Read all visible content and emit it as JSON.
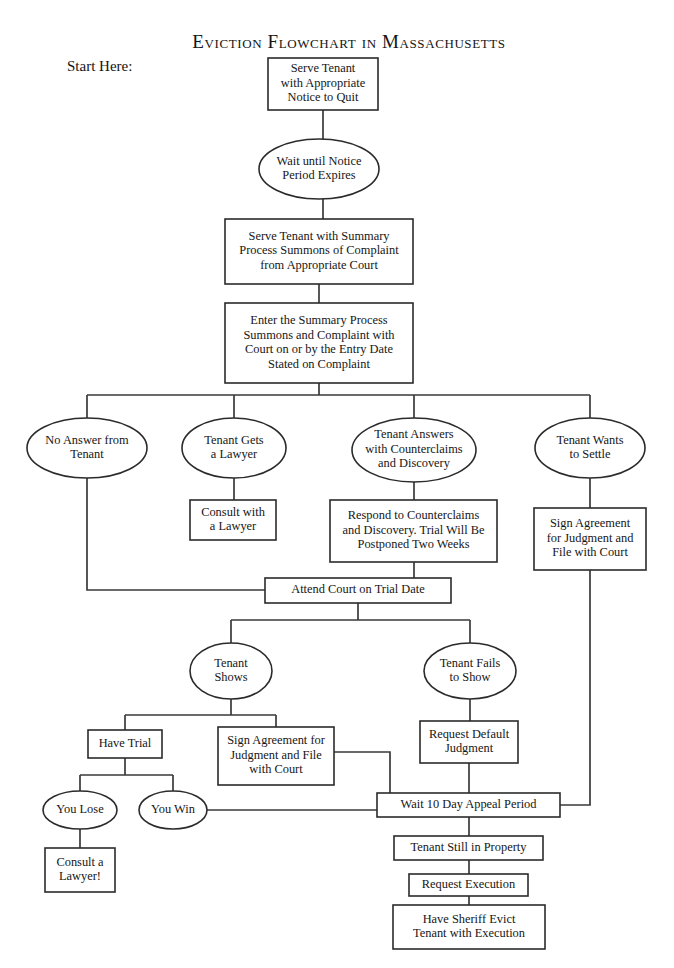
{
  "page": {
    "title": "Eviction Flowchart in Massachusetts",
    "start_label": "Start Here:",
    "background_color": "#ffffff",
    "line_color": "#3a3a3a",
    "text_color": "#161616"
  },
  "chart_data": {
    "type": "diagram",
    "title": "Eviction Flowchart in Massachusetts",
    "subtype": "flowchart",
    "orientation": "top-to-bottom",
    "shapes_legend": {
      "rect": "process / action step",
      "ellipse": "state / decision outcome"
    },
    "nodes": [
      {
        "id": "n1",
        "label": "Serve Tenant with Appropriate Notice to Quit",
        "lines": [
          "Serve Tenant",
          "with Appropriate",
          "Notice to Quit"
        ],
        "shape": "rect",
        "x": 268,
        "y": 58,
        "w": 110,
        "h": 52
      },
      {
        "id": "n2",
        "label": "Wait until Notice Period Expires",
        "lines": [
          "Wait until Notice",
          "Period Expires"
        ],
        "shape": "ellipse",
        "x": 259,
        "y": 139,
        "w": 120,
        "h": 60
      },
      {
        "id": "n3",
        "label": "Serve Tenant with Summary Process Summons of Complaint from Appropriate Court",
        "lines": [
          "Serve Tenant with Summary",
          "Process Summons of Complaint",
          "from Appropriate Court"
        ],
        "shape": "rect",
        "x": 225,
        "y": 219,
        "w": 188,
        "h": 65
      },
      {
        "id": "n4",
        "label": "Enter the Summary Process Summons and Complaint with Court on or by the Entry Date Stated on Complaint",
        "lines": [
          "Enter the Summary Process",
          "Summons and Complaint with",
          "Court on or by the Entry Date",
          "Stated on Complaint"
        ],
        "shape": "rect",
        "x": 225,
        "y": 303,
        "w": 188,
        "h": 80
      },
      {
        "id": "n5",
        "label": "No Answer from Tenant",
        "lines": [
          "No Answer from",
          "Tenant"
        ],
        "shape": "ellipse",
        "x": 27,
        "y": 418,
        "w": 120,
        "h": 60
      },
      {
        "id": "n6",
        "label": "Tenant Gets a Lawyer",
        "lines": [
          "Tenant Gets",
          "a Lawyer"
        ],
        "shape": "ellipse",
        "x": 182,
        "y": 418,
        "w": 104,
        "h": 60
      },
      {
        "id": "n7",
        "label": "Tenant Answers with Counterclaims and Discovery",
        "lines": [
          "Tenant Answers",
          "with Counterclaims",
          "and Discovery"
        ],
        "shape": "ellipse",
        "x": 352,
        "y": 418,
        "w": 124,
        "h": 64
      },
      {
        "id": "n8",
        "label": "Tenant Wants to Settle",
        "lines": [
          "Tenant Wants",
          "to Settle"
        ],
        "shape": "ellipse",
        "x": 535,
        "y": 418,
        "w": 110,
        "h": 60
      },
      {
        "id": "n9",
        "label": "Consult with a Lawyer",
        "lines": [
          "Consult with",
          "a Lawyer"
        ],
        "shape": "rect",
        "x": 190,
        "y": 500,
        "w": 86,
        "h": 40
      },
      {
        "id": "n10",
        "label": "Respond to Counterclaims and Discovery. Trial Will Be Postponed Two Weeks",
        "lines": [
          "Respond to Counterclaims",
          "and Discovery. Trial Will Be",
          "Postponed Two Weeks"
        ],
        "shape": "rect",
        "x": 330,
        "y": 500,
        "w": 167,
        "h": 62
      },
      {
        "id": "n11",
        "label": "Sign Agreement for Judgment and File with Court",
        "lines": [
          "Sign Agreement",
          "for Judgment and",
          "File with Court"
        ],
        "shape": "rect",
        "x": 534,
        "y": 508,
        "w": 112,
        "h": 62
      },
      {
        "id": "n12",
        "label": "Attend Court on Trial Date",
        "lines": [
          "Attend Court on Trial Date"
        ],
        "shape": "rect",
        "x": 265,
        "y": 578,
        "w": 186,
        "h": 25
      },
      {
        "id": "n13",
        "label": "Tenant Shows",
        "lines": [
          "Tenant",
          "Shows"
        ],
        "shape": "ellipse",
        "x": 190,
        "y": 643,
        "w": 82,
        "h": 56
      },
      {
        "id": "n14",
        "label": "Tenant Fails to Show",
        "lines": [
          "Tenant Fails",
          "to Show"
        ],
        "shape": "ellipse",
        "x": 424,
        "y": 643,
        "w": 92,
        "h": 56
      },
      {
        "id": "n15",
        "label": "Have Trial",
        "lines": [
          "Have Trial"
        ],
        "shape": "rect",
        "x": 88,
        "y": 730,
        "w": 74,
        "h": 28
      },
      {
        "id": "n16",
        "label": "Sign Agreement for Judgment and File with Court",
        "lines": [
          "Sign Agreement for",
          "Judgment and File",
          "with Court"
        ],
        "shape": "rect",
        "x": 218,
        "y": 727,
        "w": 116,
        "h": 58
      },
      {
        "id": "n17",
        "label": "Request Default Judgment",
        "lines": [
          "Request Default",
          "Judgment"
        ],
        "shape": "rect",
        "x": 420,
        "y": 721,
        "w": 98,
        "h": 42
      },
      {
        "id": "n18",
        "label": "You Lose",
        "lines": [
          "You Lose"
        ],
        "shape": "ellipse",
        "x": 43,
        "y": 791,
        "w": 74,
        "h": 38
      },
      {
        "id": "n19",
        "label": "You Win",
        "lines": [
          "You Win"
        ],
        "shape": "ellipse",
        "x": 139,
        "y": 791,
        "w": 68,
        "h": 38
      },
      {
        "id": "n20",
        "label": "Consult a Lawyer!",
        "lines": [
          "Consult a",
          "Lawyer!"
        ],
        "shape": "rect",
        "x": 45,
        "y": 848,
        "w": 70,
        "h": 44
      },
      {
        "id": "n21",
        "label": "Wait 10 Day Appeal Period",
        "lines": [
          "Wait 10 Day Appeal Period"
        ],
        "shape": "rect",
        "x": 377,
        "y": 793,
        "w": 183,
        "h": 24
      },
      {
        "id": "n22",
        "label": "Tenant Still in Property",
        "lines": [
          "Tenant Still in Property"
        ],
        "shape": "rect",
        "x": 394,
        "y": 836,
        "w": 149,
        "h": 24
      },
      {
        "id": "n23",
        "label": "Request Execution",
        "lines": [
          "Request Execution"
        ],
        "shape": "rect",
        "x": 409,
        "y": 874,
        "w": 119,
        "h": 22
      },
      {
        "id": "n24",
        "label": "Have Sheriff Evict Tenant with Execution",
        "lines": [
          "Have Sheriff Evict",
          "Tenant with Execution"
        ],
        "shape": "rect",
        "x": 393,
        "y": 905,
        "w": 152,
        "h": 44
      }
    ],
    "edges": [
      {
        "from": "n1",
        "to": "n2",
        "path": "M323,110 L323,139"
      },
      {
        "from": "n2",
        "to": "n3",
        "path": "M323,199 L323,219"
      },
      {
        "from": "n3",
        "to": "n4",
        "path": "M319,284 L319,303"
      },
      {
        "from": "n4",
        "to": "n5",
        "path": "M319,383 L319,395 M87,395 L590,395 M87,395 L87,421"
      },
      {
        "from": "n4",
        "to": "n6",
        "path": "M234,395 L234,422"
      },
      {
        "from": "n4",
        "to": "n7",
        "path": "M414,395 L414,420"
      },
      {
        "from": "n4",
        "to": "n8",
        "path": "M590,395 L590,422"
      },
      {
        "from": "n6",
        "to": "n9",
        "path": "M234,478 L234,500"
      },
      {
        "from": "n7",
        "to": "n10",
        "path": "M414,482 L414,500"
      },
      {
        "from": "n8",
        "to": "n11",
        "path": "M590,478 L590,508"
      },
      {
        "from": "n5",
        "to": "n12",
        "path": "M87,478 L87,590 L265,590"
      },
      {
        "from": "n10",
        "to": "n12",
        "path": "M414,562 L414,578"
      },
      {
        "from": "n12",
        "to": "n13",
        "path": "M358,603 L358,620 M231,620 L470,620 M231,620 L231,645"
      },
      {
        "from": "n12",
        "to": "n14",
        "path": "M470,620 L470,645"
      },
      {
        "from": "n13",
        "to": "n15",
        "path": "M231,699 L231,715 M125,715 L276,715 M125,715 L125,730"
      },
      {
        "from": "n13",
        "to": "n16",
        "path": "M276,715 L276,727"
      },
      {
        "from": "n14",
        "to": "n17",
        "path": "M470,699 L470,721"
      },
      {
        "from": "n15",
        "to": "n18",
        "path": "M125,758 L125,775 M80,775 L173,775 M80,775 L80,791"
      },
      {
        "from": "n15",
        "to": "n19",
        "path": "M173,775 L173,791"
      },
      {
        "from": "n18",
        "to": "n20",
        "path": "M80,829 L80,848"
      },
      {
        "from": "n19",
        "to": "n21",
        "path": "M207,810 L377,810"
      },
      {
        "from": "n16",
        "to": "n21",
        "path": "M334,752 L390,752 L390,793"
      },
      {
        "from": "n17",
        "to": "n21",
        "path": "M469,763 L469,793"
      },
      {
        "from": "n11",
        "to": "n21",
        "path": "M590,570 L590,805 L560,805"
      },
      {
        "from": "n21",
        "to": "n22",
        "path": "M469,817 L469,836"
      },
      {
        "from": "n22",
        "to": "n23",
        "path": "M469,860 L469,874"
      },
      {
        "from": "n23",
        "to": "n24",
        "path": "M469,896 L469,905"
      }
    ],
    "annotations": [
      {
        "id": "a1",
        "text": "Start Here:",
        "x": 67,
        "y": 71
      },
      {
        "id": "a2",
        "text": "Eviction Flowchart in Massachusetts",
        "x": 349,
        "y": 48,
        "role": "title"
      }
    ]
  }
}
